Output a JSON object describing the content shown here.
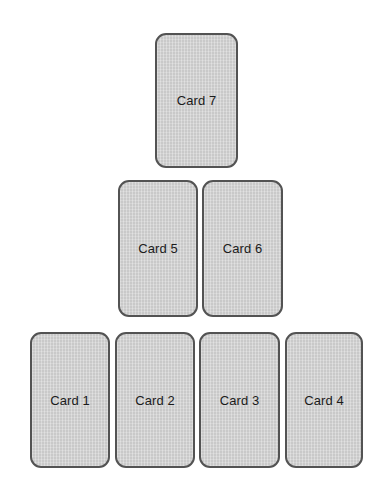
{
  "canvas": {
    "width": 392,
    "height": 490,
    "background_color": "#ffffff"
  },
  "style": {
    "card_fill": "#c9c9c9",
    "card_border_color": "#535353",
    "card_border_width": 2,
    "card_corner_radius": 11,
    "label_color": "#1b1b1b",
    "label_font_size": 13
  },
  "cards": [
    {
      "id": "card-1",
      "label": "Card 1",
      "row": "bottom",
      "x": 30,
      "y": 332,
      "width": 80,
      "height": 136
    },
    {
      "id": "card-2",
      "label": "Card 2",
      "row": "bottom",
      "x": 115,
      "y": 332,
      "width": 80,
      "height": 136
    },
    {
      "id": "card-3",
      "label": "Card 3",
      "row": "bottom",
      "x": 199,
      "y": 332,
      "width": 81,
      "height": 136
    },
    {
      "id": "card-4",
      "label": "Card 4",
      "row": "bottom",
      "x": 285,
      "y": 332,
      "width": 78,
      "height": 136
    },
    {
      "id": "card-5",
      "label": "Card 5",
      "row": "middle",
      "x": 118,
      "y": 180,
      "width": 80,
      "height": 137
    },
    {
      "id": "card-6",
      "label": "Card 6",
      "row": "middle",
      "x": 202,
      "y": 180,
      "width": 81,
      "height": 137
    },
    {
      "id": "card-7",
      "label": "Card 7",
      "row": "top",
      "x": 155,
      "y": 33,
      "width": 83,
      "height": 135
    }
  ]
}
